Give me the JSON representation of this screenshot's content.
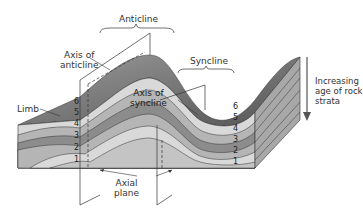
{
  "labels": {
    "anticline": "Anticline",
    "syncline": "Syncline",
    "axis_of_anticline_1": "Axis of",
    "axis_of_anticline_2": "anticline",
    "axis_of_syncline_1": "Axis of",
    "axis_of_syncline_2": "syncline",
    "limb": "Limb",
    "axial_plane_1": "Axial",
    "axial_plane_2": "plane",
    "age_1": "Increasing",
    "age_2": "age of rock",
    "age_3": "strata"
  },
  "layers_left": [
    "6",
    "5",
    "4",
    "3",
    "2",
    "1"
  ],
  "layers_right": [
    "6",
    "5",
    "4",
    "3",
    "2",
    "1"
  ],
  "colors": {
    "layer_light": "#d9d9d9",
    "layer_mid": "#b5b5b5",
    "layer_dark": "#8c8c8c",
    "surface_dark": "#6e6e6e",
    "line": "#333333"
  }
}
